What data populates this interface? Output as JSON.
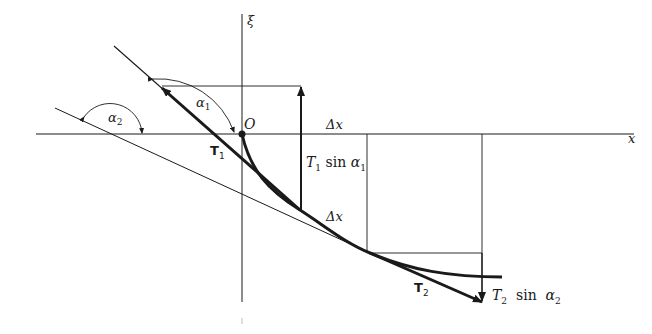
{
  "diagram": {
    "axes": {
      "x_label": "x",
      "xi_label": "ξ",
      "origin_label": "O"
    },
    "angles": {
      "alpha1": {
        "sym": "α",
        "sub": "1"
      },
      "alpha2": {
        "sym": "α",
        "sub": "2"
      }
    },
    "vectors": {
      "T1": {
        "sym": "T",
        "sub": "1"
      },
      "T2": {
        "sym": "T",
        "sub": "2"
      }
    },
    "components": {
      "T1_sin": {
        "T": "T",
        "sub": "1",
        "fn": " sin ",
        "alpha": "α",
        "asub": "1"
      },
      "T2_sin": {
        "T": "T",
        "sub": "2",
        "fn": "  sin  ",
        "alpha": "α",
        "asub": "2"
      }
    },
    "dx_top": "Δx",
    "dx_curve": "Δx",
    "colors": {
      "ink": "#1a1a1a"
    }
  }
}
